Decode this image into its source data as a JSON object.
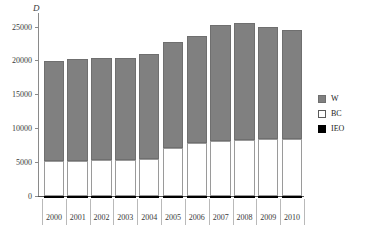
{
  "chart_data": {
    "type": "bar",
    "stacked": true,
    "title": "",
    "xlabel": "",
    "ylabel": "D",
    "ylim": [
      0,
      27000
    ],
    "yticks": [
      0,
      5000,
      10000,
      15000,
      20000,
      25000
    ],
    "ytick_labels": [
      "0",
      "5000",
      "10000",
      "15000",
      "20000",
      "25000"
    ],
    "grid": false,
    "legend_position": "right",
    "categories": [
      "2000",
      "2001",
      "2002",
      "2003",
      "2004",
      "2005",
      "2006",
      "2007",
      "2008",
      "2009",
      "2010"
    ],
    "series": [
      {
        "name": "BC",
        "color": "#ffffff",
        "values": [
          5100,
          5150,
          5200,
          5250,
          5400,
          7000,
          7700,
          8000,
          8200,
          8300,
          8350
        ]
      },
      {
        "name": "W",
        "color": "#808080",
        "values": [
          14750,
          14950,
          15150,
          15100,
          15550,
          15700,
          15900,
          17200,
          17300,
          16600,
          16100
        ]
      },
      {
        "name": "IEO",
        "color": "#000000",
        "values": [
          50,
          50,
          50,
          50,
          50,
          50,
          50,
          50,
          50,
          50,
          50
        ]
      }
    ],
    "totals": [
      19900,
      20150,
      20400,
      20400,
      21000,
      22750,
      23650,
      25250,
      25550,
      24950,
      24500
    ]
  },
  "legend": {
    "items": [
      {
        "label": "W",
        "color": "#808080"
      },
      {
        "label": "BC",
        "color": "#ffffff"
      },
      {
        "label": "IEO",
        "color": "#000000"
      }
    ]
  }
}
